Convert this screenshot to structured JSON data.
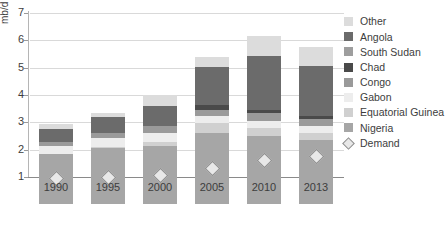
{
  "chart_data": {
    "type": "bar",
    "title": "",
    "subtitle": "",
    "xlabel": "",
    "ylabel": "mb/d",
    "categories": [
      "1990",
      "1995",
      "2000",
      "2005",
      "2010",
      "2013"
    ],
    "ylim": [
      0,
      7
    ],
    "yticks": [
      1,
      2,
      3,
      4,
      5,
      6,
      7
    ],
    "grid": true,
    "stacked": true,
    "legend_position": "right",
    "series": [
      {
        "name": "Nigeria",
        "color": "#a6a6a6",
        "values": [
          1.85,
          2.05,
          2.15,
          2.6,
          2.5,
          2.35
        ]
      },
      {
        "name": "Equatorial Guinea",
        "color": "#d0d0d0",
        "values": [
          0.0,
          0.05,
          0.12,
          0.37,
          0.3,
          0.27
        ]
      },
      {
        "name": "Gabon",
        "color": "#ededed",
        "values": [
          0.27,
          0.33,
          0.33,
          0.25,
          0.25,
          0.24
        ]
      },
      {
        "name": "Congo",
        "color": "#9a9a9a",
        "values": [
          0.15,
          0.18,
          0.25,
          0.25,
          0.3,
          0.26
        ]
      },
      {
        "name": "Chad",
        "color": "#4a4a4a",
        "values": [
          0.0,
          0.0,
          0.0,
          0.17,
          0.12,
          0.1
        ]
      },
      {
        "name": "South Sudan",
        "color": "#9e9e9e",
        "values": [
          0.0,
          0.0,
          0.0,
          0.0,
          0.0,
          0.0
        ]
      },
      {
        "name": "Angola",
        "color": "#6b6b6b",
        "values": [
          0.5,
          0.58,
          0.75,
          1.4,
          1.95,
          1.85
        ]
      },
      {
        "name": "Other",
        "color": "#dcdcdc",
        "values": [
          0.18,
          0.16,
          0.4,
          0.36,
          0.73,
          0.68
        ]
      }
    ],
    "overlay": {
      "name": "Demand",
      "marker": "diamond",
      "color": "#e8e8e8",
      "border_color": "#8f8f8f",
      "values": [
        0.95,
        1.0,
        1.05,
        1.3,
        1.6,
        1.75
      ]
    },
    "totals": [
      2.95,
      3.35,
      4.0,
      5.4,
      6.15,
      5.75
    ]
  },
  "legend": {
    "items": [
      {
        "label": "Other",
        "swatch": "#dcdcdc",
        "type": "swatch"
      },
      {
        "label": "Angola",
        "swatch": "#6b6b6b",
        "type": "swatch"
      },
      {
        "label": "South Sudan",
        "swatch": "#9e9e9e",
        "type": "swatch"
      },
      {
        "label": "Chad",
        "swatch": "#4a4a4a",
        "type": "swatch"
      },
      {
        "label": "Congo",
        "swatch": "#9a9a9a",
        "type": "swatch"
      },
      {
        "label": "Gabon",
        "swatch": "#ededed",
        "type": "swatch"
      },
      {
        "label": "Equatorial Guinea",
        "swatch": "#d0d0d0",
        "type": "swatch"
      },
      {
        "label": "Nigeria",
        "swatch": "#a6a6a6",
        "type": "swatch"
      },
      {
        "label": "Demand",
        "swatch": "#e8e8e8",
        "type": "diamond"
      }
    ]
  },
  "axis": {
    "y_unit_label": "mb/d",
    "y_tick_labels": [
      "7",
      "6",
      "5",
      "4",
      "3",
      "2",
      "1"
    ],
    "x_tick_labels": [
      "1990",
      "1995",
      "2000",
      "2005",
      "2010",
      "2013"
    ]
  }
}
